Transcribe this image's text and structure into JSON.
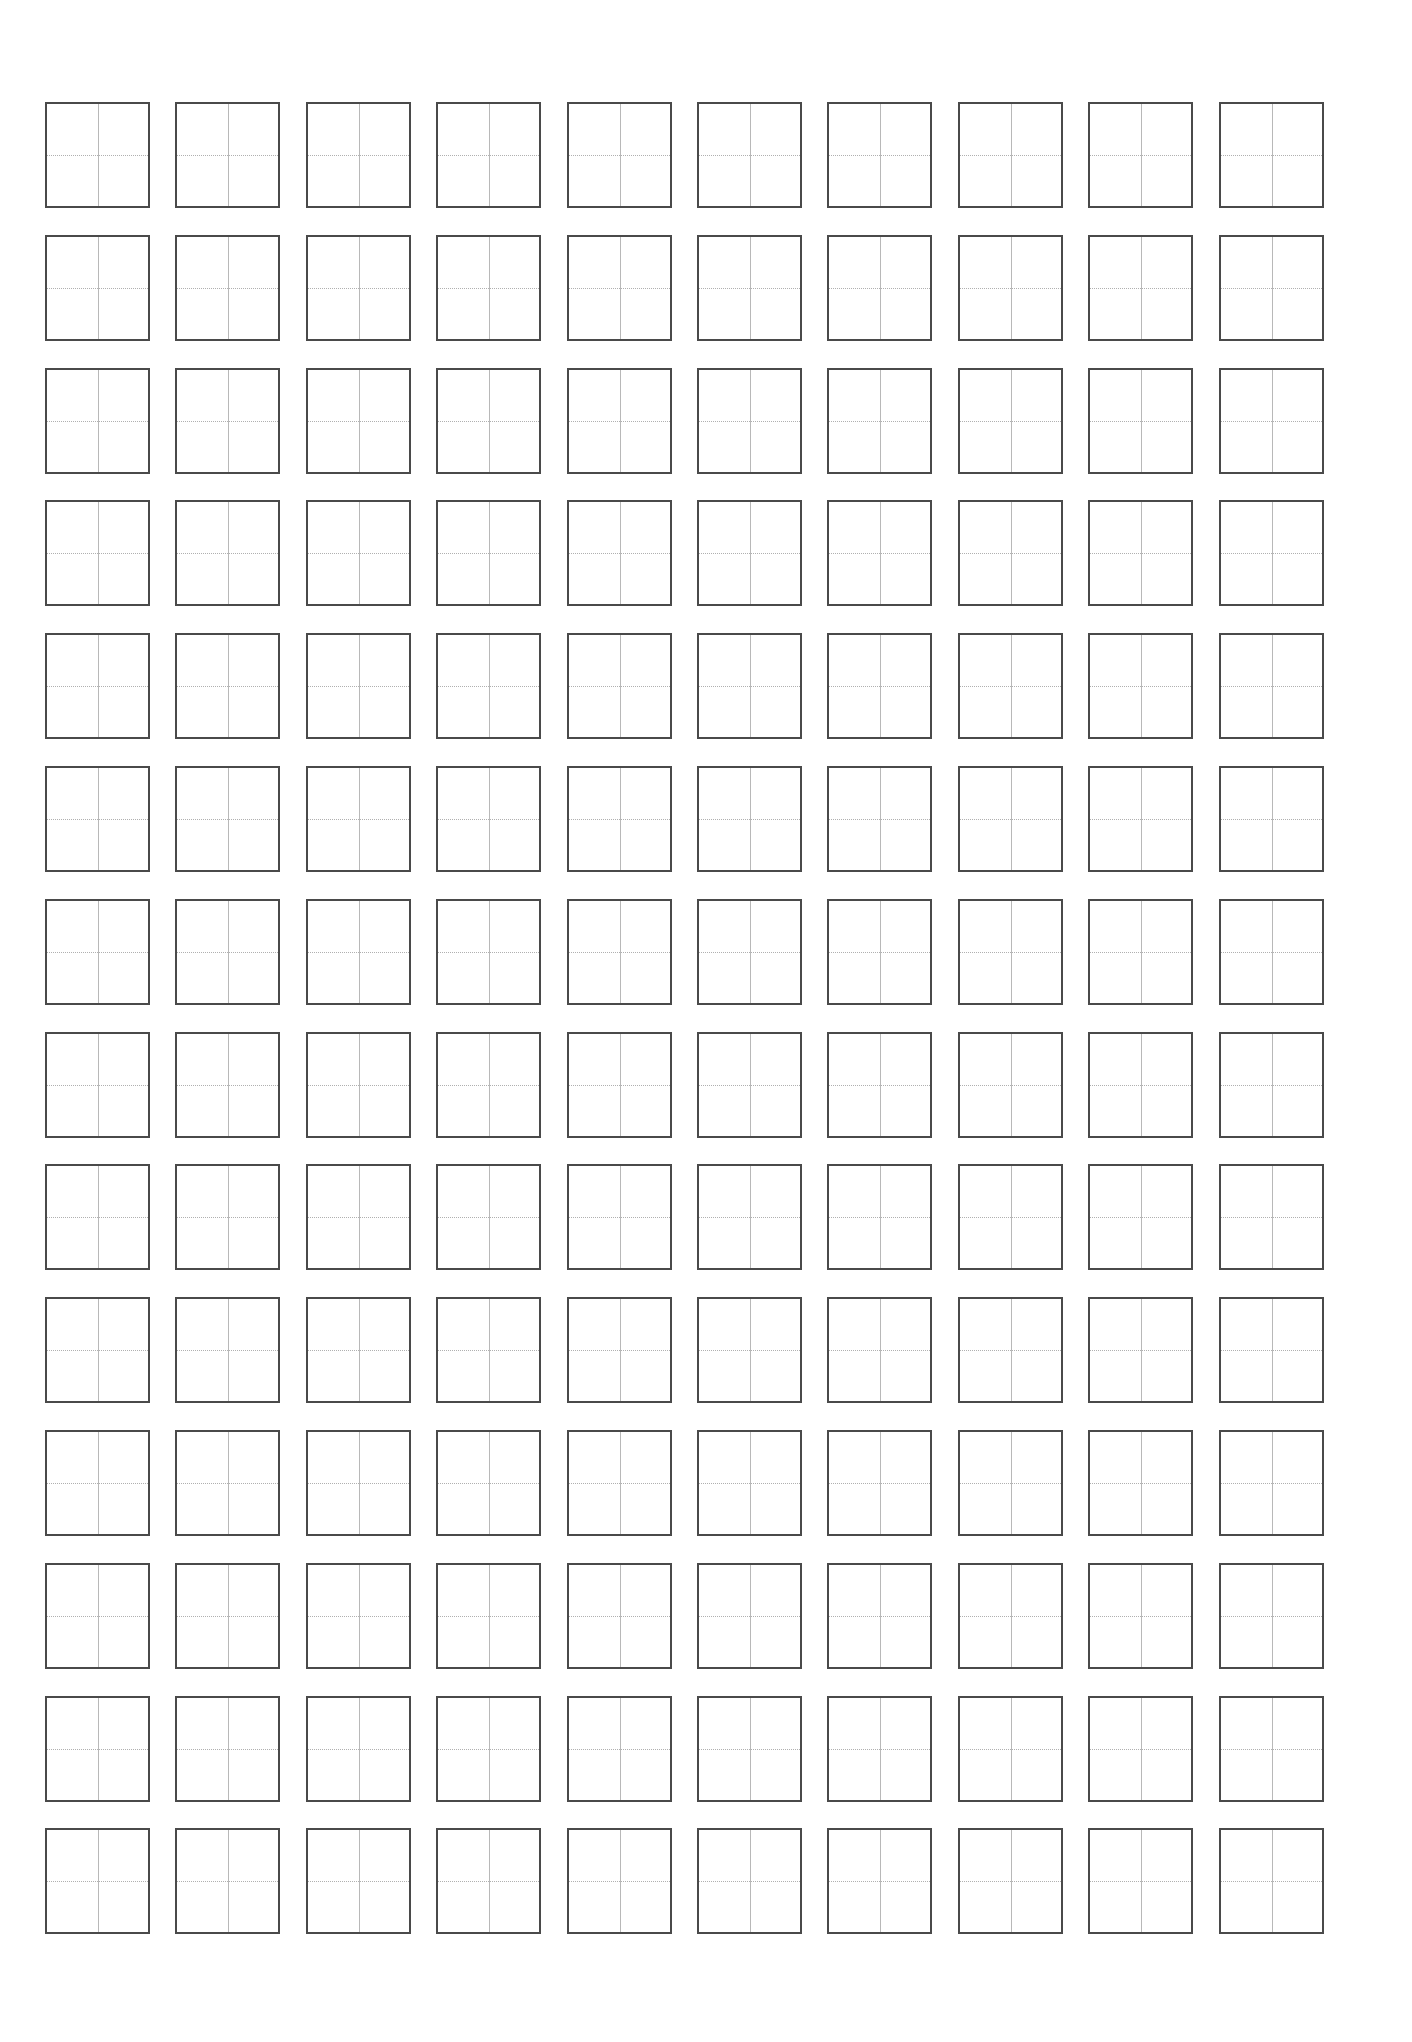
{
  "page": {
    "type": "tianzige-practice-sheet",
    "background_color": "#ffffff"
  },
  "grid": {
    "rows": 14,
    "columns": 10,
    "origin_left": 45,
    "origin_top": 102,
    "column_pitch": 130.4,
    "row_pitch": 132.8,
    "cell_width": 105,
    "cell_height": 106,
    "border_color": "#4a4a4a",
    "vertical_guide": "solid",
    "horizontal_guide": "dotted",
    "guide_color": "#b8b8b8"
  }
}
